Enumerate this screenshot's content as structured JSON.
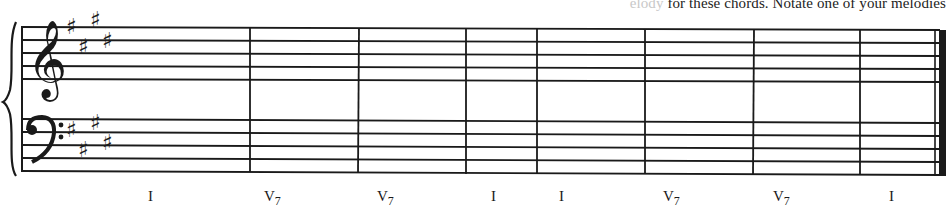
{
  "instruction": {
    "faded_prefix": "elody",
    "text": " for these chords. Notate one of your melodies"
  },
  "score": {
    "key_signature": "E major (4 sharps)",
    "staves": [
      {
        "clef": "treble",
        "sharps": 4
      },
      {
        "clef": "bass",
        "sharps": 4
      }
    ],
    "measure_count": 8,
    "final_barline": "double (thin-thick)"
  },
  "chord_progression": [
    {
      "roman": "I",
      "sup": "",
      "x": 148
    },
    {
      "roman": "V",
      "sub": "7",
      "x": 264
    },
    {
      "roman": "V",
      "sub": "7",
      "x": 377
    },
    {
      "roman": "I",
      "sup": "",
      "x": 491
    },
    {
      "roman": "I",
      "sup": "",
      "x": 559
    },
    {
      "roman": "V",
      "sub": "7",
      "x": 663
    },
    {
      "roman": "V",
      "sub": "7",
      "x": 773
    },
    {
      "roman": "I",
      "sup": "",
      "x": 889
    }
  ]
}
